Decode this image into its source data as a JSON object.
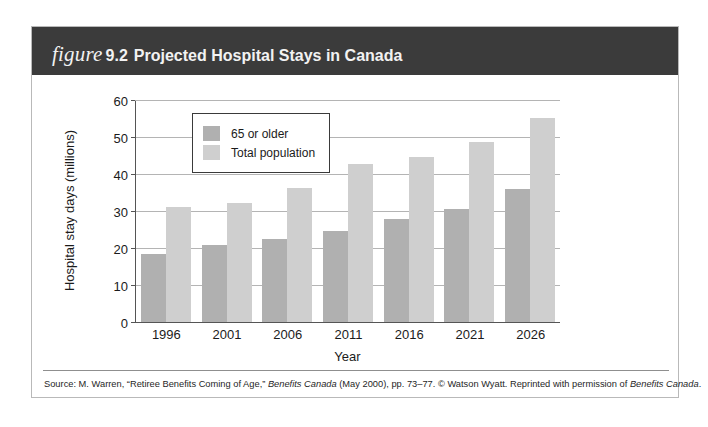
{
  "figure": {
    "label_word": "figure",
    "number": "9.2",
    "title": "Projected Hospital Stays in Canada"
  },
  "colors": {
    "header_band": "#3b3b3b",
    "senior_bar": "#b0b0b0",
    "total_bar": "#cfcfcf",
    "gridline": "#b4b4b4",
    "axis": "#555555"
  },
  "legend": {
    "items": [
      {
        "label": "65 or older",
        "color": "#b0b0b0"
      },
      {
        "label": "Total population",
        "color": "#cfcfcf"
      }
    ]
  },
  "source": {
    "prefix": "Source: M. Warren, “Retiree Benefits Coming of Age,” ",
    "italic1": "Benefits Canada",
    "middle": " (May 2000), pp. 73–77. © Watson Wyatt. Reprinted with permission of ",
    "italic2": "Benefits Canada",
    "suffix": "."
  },
  "chart_data": {
    "type": "bar",
    "title": "Projected Hospital Stays in Canada",
    "xlabel": "Year",
    "ylabel": "Hospital stay days (millions)",
    "categories": [
      "1996",
      "2001",
      "2006",
      "2011",
      "2016",
      "2021",
      "2026"
    ],
    "series": [
      {
        "name": "65 or older",
        "color": "#b0b0b0",
        "values": [
          18.5,
          20.8,
          22.5,
          24.6,
          28.0,
          30.8,
          36.0
        ]
      },
      {
        "name": "Total population",
        "color": "#cfcfcf",
        "values": [
          31.2,
          32.2,
          36.5,
          42.8,
          44.7,
          48.8,
          55.3
        ]
      }
    ],
    "ylim": [
      0,
      60
    ],
    "yticks": [
      0,
      10,
      20,
      30,
      40,
      50,
      60
    ],
    "ytick_labels": [
      "0",
      "10",
      "20",
      "30",
      "40",
      "50",
      "60"
    ],
    "grid": true,
    "legend_position": "upper-left-inside"
  }
}
